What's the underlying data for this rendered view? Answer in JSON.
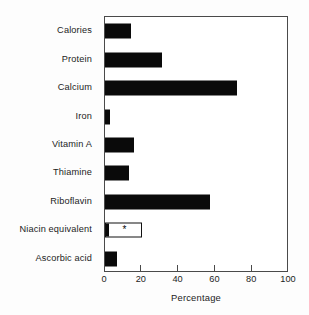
{
  "chart_data": {
    "type": "bar",
    "orientation": "horizontal",
    "title": "",
    "xlabel": "Percentage",
    "ylabel": "",
    "xlim": [
      0,
      100
    ],
    "xticks": [
      0,
      20,
      40,
      60,
      80,
      100
    ],
    "xtick_labels": [
      "0",
      "20",
      "40",
      "60",
      "80",
      "100"
    ],
    "grid": false,
    "legend": null,
    "categories": [
      "Calories",
      "Protein",
      "Calcium",
      "Iron",
      "Vitamin A",
      "Thiamine",
      "Riboflavin",
      "Niacin equivalent",
      "Ascorbic acid"
    ],
    "values": [
      14,
      31,
      72,
      2.5,
      16,
      13,
      57,
      20,
      6.5
    ],
    "bar_styles": [
      "filled",
      "filled",
      "filled",
      "filled",
      "filled",
      "filled",
      "filled",
      "hollow",
      "filled"
    ],
    "annotations": [
      {
        "category": "Niacin equivalent",
        "marker": "*",
        "at_value": 10
      }
    ],
    "colors": {
      "bar_fill": "#0a0a0a",
      "bar_outline": "#111111",
      "axis": "#4a4a4a",
      "text": "#1c1c1c",
      "background": "#fdfdfd",
      "plot_background": "#ffffff"
    }
  }
}
